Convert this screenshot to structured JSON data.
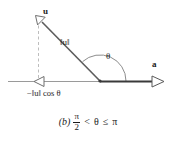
{
  "figure": {
    "panel_label": "(b)",
    "background_color": "#ffffff",
    "ink_color": "#1b1b1b",
    "vector_color": "#555555",
    "axis_color": "#8c8c8c",
    "dash_color": "#b0b0b0",
    "labels": {
      "vector_u": "u",
      "vector_a": "a",
      "magnitude_u": "‖u‖",
      "angle_theta": "θ",
      "projection": "−‖u‖ cos θ"
    },
    "caption": {
      "panel": "(b)",
      "numerator": "π",
      "denominator": "2",
      "relation_strict": "<",
      "theta": "θ",
      "relation_loose": "≤",
      "pi": "π",
      "full_text": "(b) π/2 < θ ≤ π"
    },
    "geometry": {
      "origin_x": 100,
      "origin_y": 81,
      "u_tip_x": 38,
      "u_tip_y": 18,
      "a_tip_x": 163,
      "a_tip_y": 81,
      "foot_x": 38,
      "foot_y": 81,
      "axis_left_x": 8
    }
  }
}
